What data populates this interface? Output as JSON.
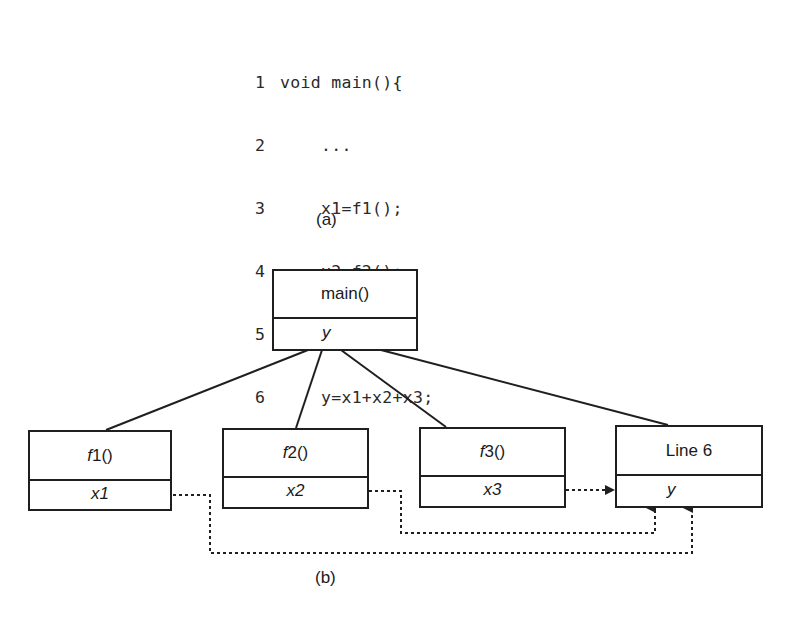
{
  "code": {
    "lines": [
      {
        "num": "1",
        "text": "void main(){"
      },
      {
        "num": "2",
        "text": "    ..."
      },
      {
        "num": "3",
        "text": "    x1=f1();"
      },
      {
        "num": "4",
        "text": "    x2=f2();"
      },
      {
        "num": "5",
        "text": "    x3=f3();"
      },
      {
        "num": "6",
        "text": "    y=x1+x2+x3;"
      },
      {
        "num": "7",
        "text": "}"
      }
    ]
  },
  "captions": {
    "a": "(a)",
    "b": "(b)"
  },
  "diagram": {
    "main": {
      "prefix": "",
      "name": "main()",
      "var": "y"
    },
    "f1": {
      "prefix": "f",
      "name": "1()",
      "var": "x1"
    },
    "f2": {
      "prefix": "f",
      "name": "2()",
      "var": "x2"
    },
    "f3": {
      "prefix": "f",
      "name": "3()",
      "var": "x3"
    },
    "line6": {
      "prefix": "",
      "name": "Line 6",
      "var": "y"
    }
  },
  "colors": {
    "stroke": "#1f1f1f",
    "background": "#ffffff"
  }
}
